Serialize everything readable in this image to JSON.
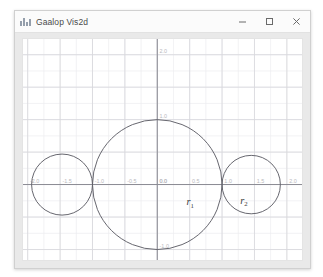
{
  "window": {
    "title": "Gaalop Vis2d",
    "icon": "chart-bars-icon",
    "controls": {
      "minimize": {
        "name": "minimize-button",
        "glyph": "–"
      },
      "maximize": {
        "name": "maximize-button",
        "glyph": "□"
      },
      "close": {
        "name": "close-button",
        "glyph": "✕"
      }
    }
  },
  "colors": {
    "window_bg": "#f4f4f4",
    "titlebar_bg": "#fbfbfb",
    "panel_bg": "#e9e9e9",
    "plot_bg": "#ffffff",
    "grid_minor": "#ededf0",
    "grid_major": "#d7d7dc",
    "axis": "#8d8d95",
    "curve": "#5d5d66",
    "tick_label": "#b9b9bd",
    "annotation": "#3a3a3a"
  },
  "chart_data": {
    "type": "scatter",
    "title": "",
    "xlabel": "",
    "ylabel": "",
    "xlim": [
      -2.0,
      2.0
    ],
    "ylim": [
      -2.0,
      2.0
    ],
    "grid": true,
    "legend": null,
    "x_ticks": [
      -2.0,
      -1.5,
      -1.0,
      -0.5,
      0.0,
      0.5,
      1.0,
      1.5,
      2.0
    ],
    "x_tick_labels": [
      "-2.0",
      "-1.5",
      "-1.0",
      "-0.5",
      "0.0",
      "0.5",
      "1.0",
      "1.5",
      "2.0"
    ],
    "y_ticks": [
      -2.0,
      -1.0,
      0.0,
      1.0,
      2.0
    ],
    "y_tick_labels": [
      "-2.0",
      "-1.0",
      "0.0",
      "1.0",
      "2.0"
    ],
    "series": [
      {
        "name": "circle-large",
        "shape": "circle",
        "center": [
          0.0,
          0.0
        ],
        "radius": 1.0
      },
      {
        "name": "circle-left",
        "shape": "circle",
        "center": [
          -1.47,
          0.0
        ],
        "radius": 0.47
      },
      {
        "name": "circle-right",
        "shape": "circle",
        "center": [
          1.45,
          0.0
        ],
        "radius": 0.45
      }
    ],
    "annotations": [
      {
        "name": "r1",
        "text": "r",
        "sub": "1",
        "x": 0.45,
        "y": -0.32
      },
      {
        "name": "r2",
        "text": "r",
        "sub": "2",
        "x": 1.28,
        "y": -0.3
      }
    ]
  }
}
